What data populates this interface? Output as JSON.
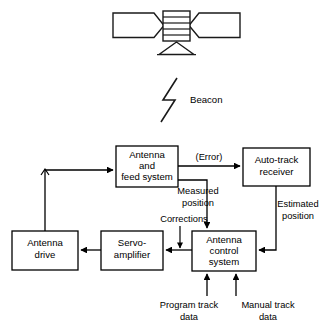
{
  "figure": {
    "type": "block-diagram",
    "colors": {
      "stroke": "#000000",
      "background": "#ffffff"
    }
  },
  "satellite": {
    "name": "satellite-illustration",
    "parts": [
      "left-solar-panel",
      "right-solar-panel",
      "body-with-bands",
      "antenna-horn"
    ]
  },
  "beacon": {
    "label": "Beacon",
    "symbol": "lightning-bolt-signal"
  },
  "blocks": [
    {
      "id": "antenna-feed-system",
      "lines": [
        "Antenna",
        "and",
        "feed system"
      ]
    },
    {
      "id": "auto-track-receiver",
      "lines": [
        "Auto-track",
        "receiver"
      ]
    },
    {
      "id": "antenna-drive",
      "lines": [
        "Antenna",
        "drive"
      ]
    },
    {
      "id": "servo-amplifier",
      "lines": [
        "Servo-",
        "amplifier"
      ]
    },
    {
      "id": "antenna-control-system",
      "lines": [
        "Antenna",
        "control",
        "system"
      ]
    }
  ],
  "edge_labels": [
    {
      "id": "error",
      "text": "(Error)"
    },
    {
      "id": "measured-position",
      "lines": [
        "Measured",
        "position"
      ]
    },
    {
      "id": "estimated-position",
      "lines": [
        "Estimated",
        "position"
      ]
    },
    {
      "id": "corrections",
      "text": "Corrections"
    },
    {
      "id": "program-track-data",
      "lines": [
        "Program track",
        "data"
      ]
    },
    {
      "id": "manual-track-data",
      "lines": [
        "Manual track",
        "data"
      ]
    }
  ]
}
